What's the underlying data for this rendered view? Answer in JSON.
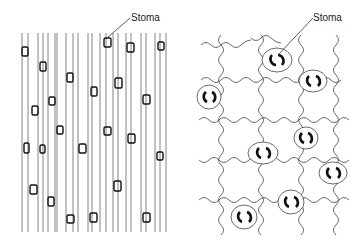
{
  "figure": {
    "left_panel": {
      "description": "Parallel-veined leaf epidermis with elongated cells and stomata in rows",
      "label": "Stoma"
    },
    "right_panel": {
      "description": "Net-veined leaf epidermis with jigsaw-shaped cells and scattered stomata",
      "label": "Stoma"
    },
    "colors": {
      "line": "#555555",
      "stoma": "#111111",
      "background": "#ffffff"
    }
  }
}
